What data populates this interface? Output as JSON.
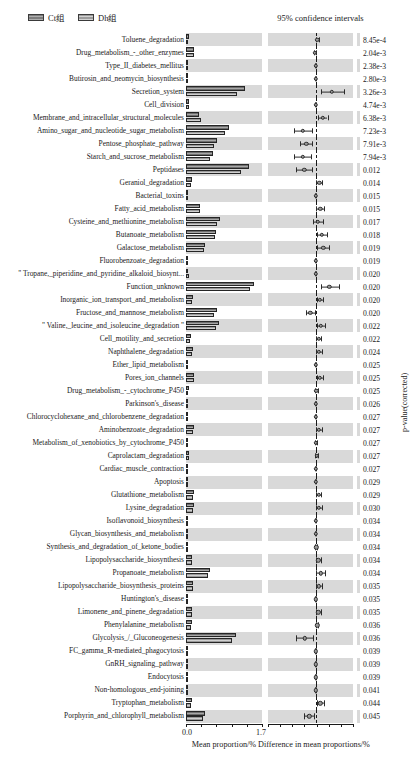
{
  "legend": {
    "items": [
      {
        "label": "Ct组",
        "key": "ct"
      },
      {
        "label": "Dh组",
        "key": "dh"
      }
    ]
  },
  "ci_panel": {
    "title": "95% confidence intervals"
  },
  "axes": {
    "left": {
      "caption": "Mean proportion/%",
      "ticks": [
        "0.0",
        "1.7"
      ],
      "min": 0.0,
      "max": 1.7
    },
    "right": {
      "caption": "Difference in mean proportions/%",
      "min": -0.56,
      "max": 0.44
    },
    "pvalue_caption": "p-value(corrected)"
  },
  "chart_data": {
    "type": "bar",
    "title": "",
    "subtitle": "",
    "xlabel": "Mean proportion/%",
    "ylabel": "",
    "legend_position": "top-left",
    "grid": false,
    "series": [
      {
        "name": "Ct组",
        "key": "ct"
      },
      {
        "name": "Dh组",
        "key": "dh"
      }
    ],
    "categories": [
      "Toluene_degradation",
      "Drug_metabolism_-_other_enzymes",
      "Type_II_diabetes_mellitus",
      "Butirosin_and_neomycin_biosynthesis",
      "Secretion_system",
      "Cell_division",
      "Membrane_and_intracellular_structural_molecules",
      "Amino_sugar_and_nucleotide_sugar_metabolism",
      "Pentose_phosphate_pathway",
      "Starch_and_sucrose_metabolism",
      "Peptidases",
      "Geraniol_degradation",
      "Bacterial_toxins",
      "Fatty_acid_metabolism",
      "Cysteine_and_methionine_metabolism",
      "Butanoate_metabolism",
      "Galactose_metabolism",
      "Fluorobenzoate_degradation",
      "\" Tropane,_piperidine_and_pyridine_alkaloid_biosynt...",
      "Function_unknown",
      "Inorganic_ion_transport_and_metabolism",
      "Fructose_and_mannose_metabolism",
      "\" Valine,_leucine_and_isoleucine_degradation \"",
      "Cell_motility_and_secretion",
      "Naphthalene_degradation",
      "Ether_lipid_metabolism",
      "Pores_ion_channels",
      "Drug_metabolism_-_cytochrome_P450",
      "Parkinson's_disease",
      "Chlorocyclohexane_and_chlorobenzene_degradation",
      "Aminobenzoate_degradation",
      "Metabolism_of_xenobiotics_by_cytochrome_P450",
      "Caprolactam_degradation",
      "Cardiac_muscle_contraction",
      "Apoptosis",
      "Glutathione_metabolism",
      "Lysine_degradation",
      "Isoflavonoid_biosynthesis",
      "Glycan_biosynthesis_and_metabolism",
      "Synthesis_and_degradation_of_ketone_bodies",
      "Lipopolysaccharide_biosynthesis",
      "Propanoate_metabolism",
      "Lipopolysaccharide_biosynthesis_proteins",
      "Huntington's_disease",
      "Limonene_and_pinene_degradation",
      "Phenylalanine_metabolism",
      "Glycolysis_/_Gluconeogenesis",
      "FC_gamma_R-mediated_phagocytosis",
      "GnRH_signaling_pathway",
      "Endocytosis",
      "Non-homologous_end-joining",
      "Tryptophan_metabolism",
      "Porphyrin_and_chlorophyll_metabolism"
    ],
    "rows": [
      {
        "category": "Toluene_degradation",
        "ct": 0.075,
        "dh": 0.055,
        "diff": 0.02,
        "lo": 0.004,
        "hi": 0.036,
        "pvalue": "8.45e-4"
      },
      {
        "category": "Drug_metabolism_-_other_enzymes",
        "ct": 0.17,
        "dh": 0.175,
        "diff": -0.007,
        "lo": -0.022,
        "hi": 0.008,
        "pvalue": "2.04e-3"
      },
      {
        "category": "Type_II_diabetes_mellitus",
        "ct": 0.04,
        "dh": 0.04,
        "diff": 0.001,
        "lo": -0.006,
        "hi": 0.008,
        "pvalue": "2.38e-3"
      },
      {
        "category": "Butirosin_and_neomycin_biosynthesis",
        "ct": 0.035,
        "dh": 0.032,
        "diff": 0.002,
        "lo": -0.005,
        "hi": 0.009,
        "pvalue": "2.80e-3"
      },
      {
        "category": "Secretion_system",
        "ct": 1.33,
        "dh": 1.13,
        "diff": 0.19,
        "lo": 0.06,
        "hi": 0.33,
        "pvalue": "3.26e-3"
      },
      {
        "category": "Cell_division",
        "ct": 0.062,
        "dh": 0.066,
        "diff": 0.0,
        "lo": -0.008,
        "hi": 0.008,
        "pvalue": "4.74e-3"
      },
      {
        "category": "Membrane_and_intracellular_structural_molecules",
        "ct": 0.3,
        "dh": 0.33,
        "diff": 0.085,
        "lo": 0.03,
        "hi": 0.14,
        "pvalue": "6.38e-3"
      },
      {
        "category": "Amino_sugar_and_nucleotide_sugar_metabolism",
        "ct": 0.96,
        "dh": 0.88,
        "diff": -0.15,
        "lo": -0.26,
        "hi": -0.04,
        "pvalue": "7.23e-3"
      },
      {
        "category": "Pentose_phosphate_pathway",
        "ct": 0.69,
        "dh": 0.62,
        "diff": -0.11,
        "lo": -0.185,
        "hi": -0.04,
        "pvalue": "7.91e-3"
      },
      {
        "category": "Starch_and_sucrose_metabolism",
        "ct": 0.6,
        "dh": 0.54,
        "diff": -0.15,
        "lo": -0.255,
        "hi": -0.05,
        "pvalue": "7.94e-3"
      },
      {
        "category": "Peptidases",
        "ct": 1.42,
        "dh": 1.23,
        "diff": -0.135,
        "lo": -0.235,
        "hi": -0.04,
        "pvalue": "0.012"
      },
      {
        "category": "Geraniol_degradation",
        "ct": 0.13,
        "dh": 0.11,
        "diff": 0.042,
        "lo": 0.008,
        "hi": 0.08,
        "pvalue": "0.014"
      },
      {
        "category": "Bacterial_toxins",
        "ct": 0.045,
        "dh": 0.048,
        "diff": 0.001,
        "lo": -0.005,
        "hi": 0.007,
        "pvalue": "0.015"
      },
      {
        "category": "Fatty_acid_metabolism",
        "ct": 0.32,
        "dh": 0.31,
        "diff": 0.055,
        "lo": 0.01,
        "hi": 0.1,
        "pvalue": "0.015"
      },
      {
        "category": "Cysteine_and_methionine_metabolism",
        "ct": 0.76,
        "dh": 0.7,
        "diff": 0.025,
        "lo": -0.035,
        "hi": 0.085,
        "pvalue": "0.017"
      },
      {
        "category": "Butanoate_metabolism",
        "ct": 0.68,
        "dh": 0.64,
        "diff": 0.075,
        "lo": 0.018,
        "hi": 0.135,
        "pvalue": "0.018"
      },
      {
        "category": "Galactose_metabolism",
        "ct": 0.43,
        "dh": 0.4,
        "diff": 0.09,
        "lo": 0.02,
        "hi": 0.16,
        "pvalue": "0.019"
      },
      {
        "category": "Fluorobenzoate_degradation",
        "ct": 0.01,
        "dh": 0.009,
        "diff": 0.0,
        "lo": -0.004,
        "hi": 0.004,
        "pvalue": "0.019"
      },
      {
        "category": "\" Tropane,_piperidine_and_pyridine_alkaloid_biosynt...",
        "ct": 0.055,
        "dh": 0.058,
        "diff": 0.001,
        "lo": -0.006,
        "hi": 0.008,
        "pvalue": "0.020"
      },
      {
        "category": "Function_unknown",
        "ct": 1.52,
        "dh": 1.44,
        "diff": 0.16,
        "lo": 0.06,
        "hi": 0.27,
        "pvalue": "0.020"
      },
      {
        "category": "Inorganic_ion_transport_and_metabolism",
        "ct": 0.16,
        "dh": 0.145,
        "diff": 0.048,
        "lo": 0.015,
        "hi": 0.082,
        "pvalue": "0.020"
      },
      {
        "category": "Fructose_and_mannose_metabolism",
        "ct": 0.69,
        "dh": 0.62,
        "diff": -0.062,
        "lo": -0.115,
        "hi": -0.012,
        "pvalue": "0.020"
      },
      {
        "category": "\" Valine,_leucine_and_isoleucine_degradation \"",
        "ct": 0.73,
        "dh": 0.68,
        "diff": 0.06,
        "lo": 0.012,
        "hi": 0.11,
        "pvalue": "0.022"
      },
      {
        "category": "Cell_motility_and_secretion",
        "ct": 0.12,
        "dh": 0.1,
        "diff": 0.035,
        "lo": 0.006,
        "hi": 0.065,
        "pvalue": "0.022"
      },
      {
        "category": "Naphthalene_degradation",
        "ct": 0.15,
        "dh": 0.13,
        "diff": 0.04,
        "lo": 0.008,
        "hi": 0.075,
        "pvalue": "0.024"
      },
      {
        "category": "Ether_lipid_metabolism",
        "ct": 0.012,
        "dh": 0.01,
        "diff": 0.0,
        "lo": -0.004,
        "hi": 0.004,
        "pvalue": "0.025"
      },
      {
        "category": "Pores_ion_channels",
        "ct": 0.19,
        "dh": 0.17,
        "diff": 0.05,
        "lo": 0.012,
        "hi": 0.09,
        "pvalue": "0.025"
      },
      {
        "category": "Drug_metabolism_-_cytochrome_P450",
        "ct": 0.058,
        "dh": 0.055,
        "diff": 0.01,
        "lo": -0.004,
        "hi": 0.024,
        "pvalue": "0.025"
      },
      {
        "category": "Parkinson's_disease",
        "ct": 0.015,
        "dh": 0.013,
        "diff": 0.0,
        "lo": -0.004,
        "hi": 0.004,
        "pvalue": "0.026"
      },
      {
        "category": "Chlorocyclohexane_and_chlorobenzene_degradation",
        "ct": 0.055,
        "dh": 0.05,
        "diff": 0.002,
        "lo": -0.006,
        "hi": 0.01,
        "pvalue": "0.027"
      },
      {
        "category": "Aminobenzoate_degradation",
        "ct": 0.175,
        "dh": 0.16,
        "diff": 0.04,
        "lo": 0.008,
        "hi": 0.075,
        "pvalue": "0.027"
      },
      {
        "category": "Metabolism_of_xenobiotics_by_cytochrome_P450",
        "ct": 0.055,
        "dh": 0.052,
        "diff": 0.003,
        "lo": -0.006,
        "hi": 0.012,
        "pvalue": "0.027"
      },
      {
        "category": "Caprolactam_degradation",
        "ct": 0.068,
        "dh": 0.062,
        "diff": 0.014,
        "lo": -0.003,
        "hi": 0.032,
        "pvalue": "0.027"
      },
      {
        "category": "Cardiac_muscle_contraction",
        "ct": 0.01,
        "dh": 0.009,
        "diff": 0.0,
        "lo": -0.003,
        "hi": 0.003,
        "pvalue": "0.027"
      },
      {
        "category": "Apoptosis",
        "ct": 0.008,
        "dh": 0.007,
        "diff": 0.0,
        "lo": -0.003,
        "hi": 0.003,
        "pvalue": "0.029"
      },
      {
        "category": "Glutathione_metabolism",
        "ct": 0.175,
        "dh": 0.16,
        "diff": 0.035,
        "lo": 0.005,
        "hi": 0.066,
        "pvalue": "0.029"
      },
      {
        "category": "Lysine_degradation",
        "ct": 0.18,
        "dh": 0.165,
        "diff": 0.038,
        "lo": 0.007,
        "hi": 0.07,
        "pvalue": "0.030"
      },
      {
        "category": "Isoflavonoid_biosynthesis",
        "ct": 0.008,
        "dh": 0.007,
        "diff": 0.0,
        "lo": -0.003,
        "hi": 0.003,
        "pvalue": "0.034"
      },
      {
        "category": "Glycan_biosynthesis_and_metabolism",
        "ct": 0.03,
        "dh": 0.028,
        "diff": 0.001,
        "lo": -0.004,
        "hi": 0.006,
        "pvalue": "0.034"
      },
      {
        "category": "Synthesis_and_degradation_of_ketone_bodies",
        "ct": 0.055,
        "dh": 0.05,
        "diff": 0.008,
        "lo": -0.005,
        "hi": 0.021,
        "pvalue": "0.034"
      },
      {
        "category": "Lipopolysaccharide_biosynthesis",
        "ct": 0.145,
        "dh": 0.13,
        "diff": 0.03,
        "lo": 0.004,
        "hi": 0.058,
        "pvalue": "0.034"
      },
      {
        "category": "Propanoate_metabolism",
        "ct": 0.54,
        "dh": 0.5,
        "diff": 0.062,
        "lo": 0.01,
        "hi": 0.115,
        "pvalue": "0.034"
      },
      {
        "category": "Lipopolysaccharide_biosynthesis_proteins",
        "ct": 0.165,
        "dh": 0.15,
        "diff": 0.038,
        "lo": 0.006,
        "hi": 0.072,
        "pvalue": "0.035"
      },
      {
        "category": "Huntington's_disease",
        "ct": 0.048,
        "dh": 0.045,
        "diff": 0.002,
        "lo": -0.005,
        "hi": 0.009,
        "pvalue": "0.035"
      },
      {
        "category": "Limonene_and_pinene_degradation",
        "ct": 0.14,
        "dh": 0.125,
        "diff": 0.03,
        "lo": 0.003,
        "hi": 0.058,
        "pvalue": "0.035"
      },
      {
        "category": "Phenylalanine_metabolism",
        "ct": 0.135,
        "dh": 0.12,
        "diff": 0.018,
        "lo": 0.003,
        "hi": 0.034,
        "pvalue": "0.036"
      },
      {
        "category": "Glycolysis_/_Gluconeogenesis",
        "ct": 1.12,
        "dh": 1.02,
        "diff": -0.13,
        "lo": -0.23,
        "hi": -0.032,
        "pvalue": "0.036"
      },
      {
        "category": "FC_gamma_R-mediated_phagocytosis",
        "ct": 0.01,
        "dh": 0.009,
        "diff": 0.0,
        "lo": -0.003,
        "hi": 0.003,
        "pvalue": "0.039"
      },
      {
        "category": "GnRH_signaling_pathway",
        "ct": 0.009,
        "dh": 0.008,
        "diff": 0.0,
        "lo": -0.003,
        "hi": 0.003,
        "pvalue": "0.039"
      },
      {
        "category": "Endocytosis",
        "ct": 0.009,
        "dh": 0.008,
        "diff": 0.0,
        "lo": -0.003,
        "hi": 0.003,
        "pvalue": "0.039"
      },
      {
        "category": "Non-homologous_end-joining",
        "ct": 0.012,
        "dh": 0.011,
        "diff": 0.0,
        "lo": -0.003,
        "hi": 0.003,
        "pvalue": "0.041"
      },
      {
        "category": "Tryptophan_metabolism",
        "ct": 0.13,
        "dh": 0.115,
        "diff": 0.055,
        "lo": 0.012,
        "hi": 0.098,
        "pvalue": "0.044"
      },
      {
        "category": "Porphyrin_and_chlorophyll_metabolism",
        "ct": 0.42,
        "dh": 0.38,
        "diff": -0.075,
        "lo": -0.135,
        "hi": -0.018,
        "pvalue": "0.045"
      }
    ]
  }
}
